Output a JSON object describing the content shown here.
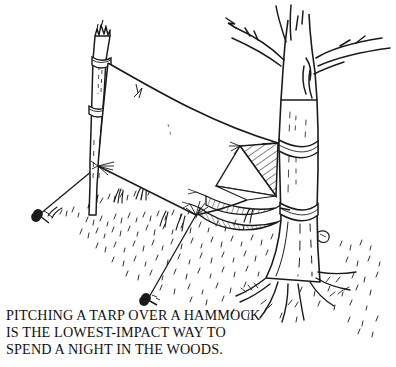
{
  "figure": {
    "style": "pen-and-ink line drawing",
    "background_color": "#ffffff",
    "ink_color": "#1a1a1a"
  },
  "caption": {
    "lines": [
      "PITCHING A TARP OVER A HAMMOCK",
      "IS THE LOWEST-IMPACT WAY TO",
      "SPEND A NIGHT IN THE WOODS."
    ],
    "full_text": "PITCHING A TARP OVER A HAMMOCK IS THE LOWEST-IMPACT WAY TO SPEND A NIGHT IN THE WOODS.",
    "color": "#111111"
  },
  "scene": {
    "elements": [
      {
        "name": "sapling-pole",
        "label": "Cut sapling pole (left support)"
      },
      {
        "name": "pole-rope-upper",
        "label": "Upper rope wrap on pole"
      },
      {
        "name": "pole-rope-lower",
        "label": "Lower rope wrap on pole"
      },
      {
        "name": "tarp",
        "label": "Tarp stretched as a ridge shelter"
      },
      {
        "name": "tarp-ridgeline",
        "label": "Tarp ridgeline"
      },
      {
        "name": "tarp-end-panel",
        "label": "Hatched triangular end panel of tarp"
      },
      {
        "name": "hammock",
        "label": "Hammock slung beneath the tarp"
      },
      {
        "name": "guy-line-left",
        "label": "Left guy line to stake"
      },
      {
        "name": "guy-line-front",
        "label": "Front guy line to stake"
      },
      {
        "name": "stake-left",
        "label": "Left ground stake"
      },
      {
        "name": "stake-front",
        "label": "Front ground stake"
      },
      {
        "name": "tree",
        "label": "Large tree (right support)"
      },
      {
        "name": "tree-rope-upper",
        "label": "Upper rope wrap on tree"
      },
      {
        "name": "tree-rope-lower",
        "label": "Lower rope wrap on tree"
      },
      {
        "name": "tree-branches",
        "label": "Bare tree branches"
      },
      {
        "name": "tree-roots",
        "label": "Exposed tree roots"
      },
      {
        "name": "ground",
        "label": "Stippled grassy ground"
      }
    ]
  }
}
